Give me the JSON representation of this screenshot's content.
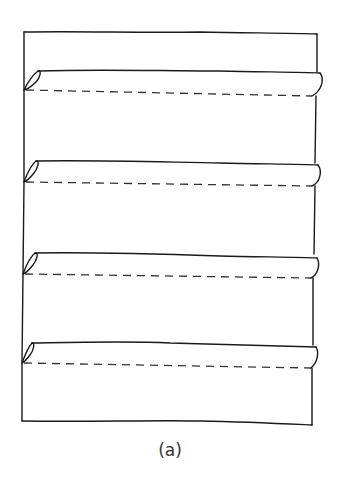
{
  "figure": {
    "caption": "(a)",
    "stroke_color": "#1a1a1a",
    "dash_color": "#333333",
    "panel": {
      "left": 24,
      "top": 32,
      "right": 317,
      "bottom": 423
    },
    "pleats": [
      {
        "index": 1,
        "top_y": 70,
        "dash_y_left": 90,
        "dash_y_right": 96
      },
      {
        "index": 2,
        "top_y": 161,
        "dash_y_left": 182,
        "dash_y_right": 186
      },
      {
        "index": 3,
        "top_y": 253,
        "dash_y_left": 274,
        "dash_y_right": 278
      },
      {
        "index": 4,
        "top_y": 343,
        "dash_y_left": 363,
        "dash_y_right": 368
      }
    ]
  }
}
